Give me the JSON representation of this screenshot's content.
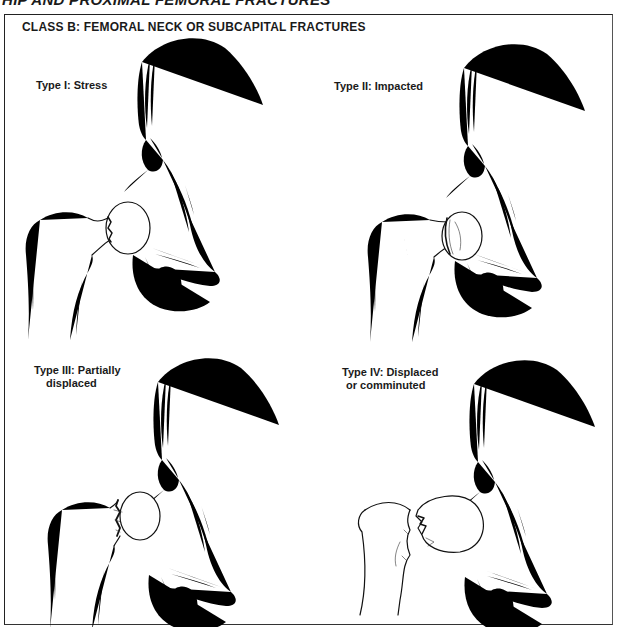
{
  "page": {
    "clipped_title": "HIP AND PROXIMAL FEMORAL FRACTURES",
    "class_heading": "CLASS B: FEMORAL NECK OR SUBCAPITAL FRACTURES"
  },
  "panels": [
    {
      "id": "type-1",
      "label_line1": "Type I: Stress",
      "label_line2": "",
      "fracture": "stress crack line across femoral neck"
    },
    {
      "id": "type-2",
      "label_line1": "Type II: Impacted",
      "label_line2": "",
      "fracture": "impacted femoral head onto neck"
    },
    {
      "id": "type-3",
      "label_line1": "Type III: Partially",
      "label_line2": "displaced",
      "fracture": "partially displaced subcapital fracture"
    },
    {
      "id": "type-4",
      "label_line1": "Type IV: Displaced",
      "label_line2": "or comminuted",
      "fracture": "displaced comminuted fragments"
    }
  ],
  "colors": {
    "line": "#111111",
    "background": "#ffffff",
    "frame": "#222222"
  }
}
